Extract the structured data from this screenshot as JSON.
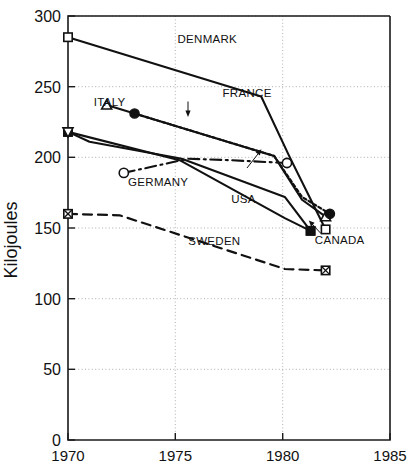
{
  "chart_data": {
    "type": "line",
    "title": "",
    "xlabel": "",
    "ylabel": "Kilojoules",
    "xlim": [
      1970,
      1985
    ],
    "ylim": [
      0,
      300
    ],
    "xticks": [
      1970,
      1975,
      1980,
      1985
    ],
    "yticks": [
      0,
      50,
      100,
      150,
      200,
      250,
      300
    ],
    "xtick_labels": [
      "1970",
      "1975",
      "1980",
      "1985"
    ],
    "ytick_labels": [
      "0",
      "50",
      "100",
      "150",
      "200",
      "250",
      "300"
    ],
    "grid": true,
    "legend": "inline-annotations",
    "series": [
      {
        "name": "DENMARK",
        "marker": "open-square",
        "line": "solid",
        "x": [
          1970,
          1979,
          1980.3,
          1982
        ],
        "values": [
          285,
          243,
          201,
          149
        ]
      },
      {
        "name": "ITALY",
        "marker": "open-triangle-up",
        "line": "solid",
        "x": [
          1971.8,
          1979.6,
          1980.9,
          1982
        ],
        "values": [
          237,
          201,
          170,
          158
        ]
      },
      {
        "name": "FRANCE",
        "marker": "filled-circle",
        "line": "dotted",
        "x": [
          1973.1,
          1979.6,
          1980.9,
          1982.2
        ],
        "values": [
          231,
          201,
          172,
          160
        ]
      },
      {
        "name": "GERMANY",
        "marker": "open-circle",
        "line": "dash-dot",
        "x": [
          1972.6,
          1975.6,
          1977.5,
          1980.2
        ],
        "values": [
          189,
          199,
          198,
          196
        ]
      },
      {
        "name": "USA",
        "marker": "filled-square",
        "line": "solid",
        "x": [
          1970,
          1971,
          1975.3,
          1980.1,
          1981.3
        ],
        "values": [
          218,
          211,
          199,
          172,
          148
        ]
      },
      {
        "name": "CANADA",
        "marker": "filled-square",
        "line": "solid",
        "x": [
          1970,
          1975.2,
          1980.1,
          1981.3
        ],
        "values": [
          218,
          198,
          157,
          148
        ]
      },
      {
        "name": "SWEDEN",
        "marker": "crossed-square",
        "line": "dashed",
        "x": [
          1970,
          1972.4,
          1980.1,
          1982
        ],
        "values": [
          160,
          159,
          121,
          120
        ]
      }
    ],
    "annotations": [
      {
        "text": "DENMARK",
        "x": 1975.1,
        "y": 281
      },
      {
        "text": "ITALY",
        "x": 1971.2,
        "y": 236
      },
      {
        "text": "FRANCE",
        "x": 1977.2,
        "y": 243
      },
      {
        "text": "GERMANY",
        "x": 1972.8,
        "y": 180
      },
      {
        "text": "USA",
        "x": 1977.6,
        "y": 168
      },
      {
        "text": "SWEDEN",
        "x": 1975.6,
        "y": 138
      },
      {
        "text": "CANADA",
        "x": 1981.5,
        "y": 139
      }
    ],
    "colors": {
      "ink": "#111111",
      "grid": "#9a9a9a",
      "background": "#ffffff"
    }
  }
}
